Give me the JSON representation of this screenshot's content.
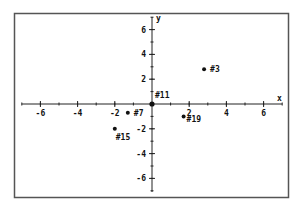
{
  "chart_data": {
    "type": "scatter",
    "title": "",
    "xlabel": "x",
    "ylabel": "y",
    "xlim": [
      -7,
      7
    ],
    "ylim": [
      -7,
      7
    ],
    "grid": false,
    "legend": null,
    "x_ticks": [
      -6,
      -4,
      -2,
      2,
      4,
      6
    ],
    "y_ticks": [
      6,
      4,
      2,
      -2,
      -4,
      -6
    ],
    "points": [
      {
        "label": "#3",
        "x": 2.8,
        "y": 2.8
      },
      {
        "label": "#11",
        "x": 0,
        "y": 0
      },
      {
        "label": "#7",
        "x": -1.3,
        "y": -0.7
      },
      {
        "label": "#15",
        "x": -2.0,
        "y": -2.0
      },
      {
        "label": "#19",
        "x": 1.7,
        "y": -1.0
      }
    ]
  },
  "style": {
    "frame_color": "#555555",
    "axis_color": "#222222",
    "point_color": "#111111"
  }
}
